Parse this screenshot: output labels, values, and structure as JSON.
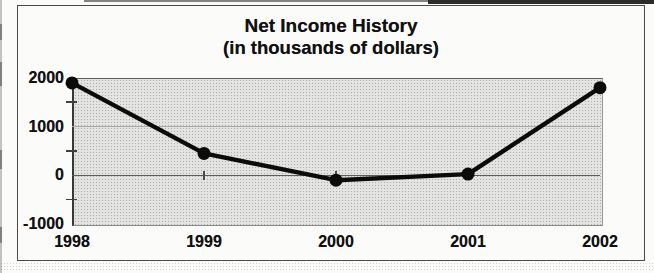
{
  "page": {
    "background": "#fbfbf9"
  },
  "chart_data": {
    "type": "line",
    "title": "Net Income History",
    "subtitle": "(in thousands of dollars)",
    "categories": [
      "1998",
      "1999",
      "2000",
      "2001",
      "2002"
    ],
    "values": [
      1900,
      450,
      -100,
      25,
      1800
    ],
    "xlabel": "",
    "ylabel": "",
    "ylim": [
      -1000,
      2000
    ],
    "y_ticks": [
      2000,
      1000,
      0,
      -1000
    ],
    "y_tick_labels": [
      "2000",
      "1000",
      "0",
      "-1000"
    ],
    "y_minor_ticks": [
      1500,
      500,
      -500
    ],
    "grid": true,
    "legend": false,
    "line_color": "#0b0b0b",
    "marker": "circle",
    "marker_color": "#0b0b0b",
    "plot_background": "#d9d9d7",
    "text_color": "#111111",
    "frame_border_color": "#4a4a4a"
  }
}
